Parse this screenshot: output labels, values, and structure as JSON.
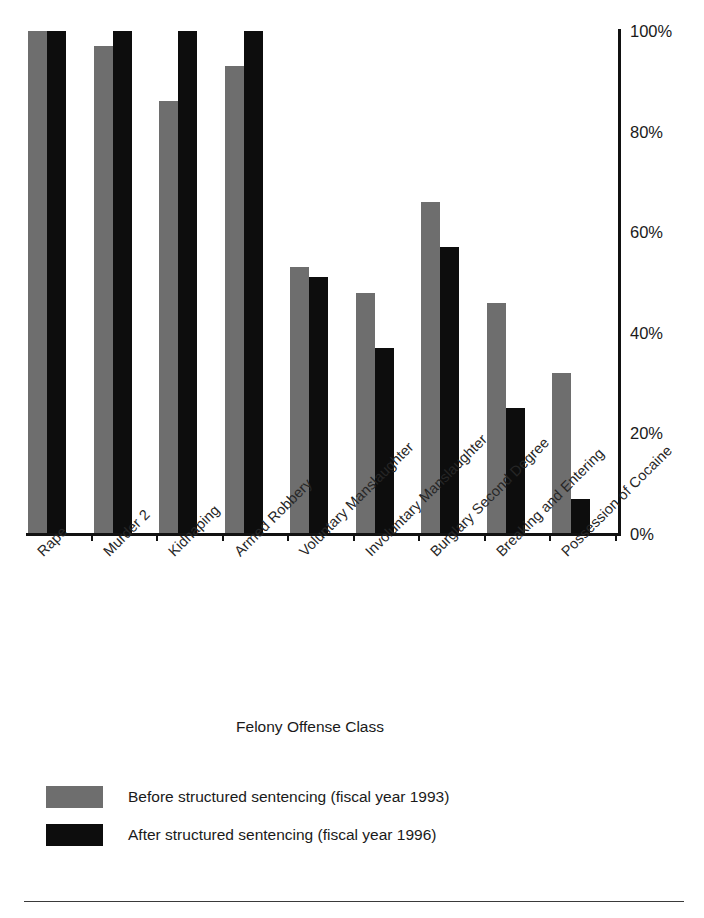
{
  "figure": {
    "title_remnant": "",
    "axis_title_x": "Felony Offense Class"
  },
  "chart_data": {
    "type": "bar",
    "title": "",
    "xlabel": "Felony Offense Class",
    "ylabel": "",
    "ylim": [
      0,
      100
    ],
    "grid": false,
    "legend_position": "bottom-left",
    "y_ticks": [
      "0%",
      "20%",
      "40%",
      "60%",
      "80%",
      "100%"
    ],
    "y_tick_values": [
      0,
      20,
      40,
      60,
      80,
      100
    ],
    "categories": [
      "Rape",
      "Murder 2",
      "Kidnaping",
      "Armed Robbery",
      "Voluntary Manslaughter",
      "Involuntary Manslaughter",
      "Burglary Second Degree",
      "Breaking and Entering",
      "Possession of Cocaine"
    ],
    "series": [
      {
        "name": "Before structured sentencing (fiscal year 1993)",
        "color": "#6e6e6e",
        "values": [
          100,
          97,
          86,
          93,
          53,
          48,
          66,
          46,
          32
        ]
      },
      {
        "name": "After structured sentencing (fiscal year 1996)",
        "color": "#0d0d0d",
        "values": [
          100,
          100,
          100,
          100,
          51,
          37,
          57,
          25,
          7
        ]
      }
    ]
  },
  "legend": {
    "items": [
      {
        "label": "Before structured sentencing (fiscal year 1993)",
        "color": "#6e6e6e"
      },
      {
        "label": "After structured sentencing (fiscal year 1996)",
        "color": "#0d0d0d"
      }
    ]
  }
}
